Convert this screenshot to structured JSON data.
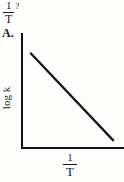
{
  "question_stub": {
    "expression_numerator": "1",
    "expression_denominator": "T",
    "question_mark": "?"
  },
  "answer": {
    "label": "A."
  },
  "chart_data": {
    "type": "line",
    "title": "",
    "subtitle": "",
    "xlabel_numerator": "1",
    "xlabel_denominator": "T",
    "xlabel": "1/T",
    "ylabel": "log k",
    "grid": false,
    "legend": "none",
    "axes": {
      "x_tick_labels": [],
      "y_tick_labels": [],
      "xlim": [
        0,
        1
      ],
      "ylim": [
        0,
        1
      ]
    },
    "series": [
      {
        "name": "log k vs 1/T",
        "description": "straight line with negative slope",
        "x": [
          0.09,
          0.9
        ],
        "y": [
          0.83,
          0.07
        ],
        "color": "#111111"
      }
    ]
  },
  "colors": {
    "axis": "#111111",
    "line": "#111111",
    "background": "#fdfdfc",
    "text": "#1a1a1a"
  }
}
